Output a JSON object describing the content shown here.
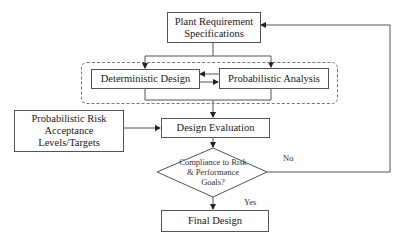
{
  "diagram": {
    "type": "flowchart",
    "nodes": {
      "plant_requirements": {
        "label": "Plant Requirement Specifications",
        "lines": [
          "Plant Requirement",
          "Specifications"
        ]
      },
      "deterministic_design": {
        "label": "Deterministic Design"
      },
      "probabilistic_analysis": {
        "label": "Probabilistic Analysis"
      },
      "risk_acceptance": {
        "label": "Probabilistic Risk Acceptance Levels/Targets",
        "lines": [
          "Probabilistic Risk",
          "Acceptance",
          "Levels/Targets"
        ]
      },
      "design_evaluation": {
        "label": "Design Evaluation"
      },
      "compliance_decision": {
        "label": "Compliance to Risk & Performance Goals?",
        "lines": [
          "Compliance to Risk",
          "& Performance",
          "Goals?"
        ]
      },
      "final_design": {
        "label": "Final Design"
      }
    },
    "edge_labels": {
      "yes": "Yes",
      "no": "No"
    },
    "edges": [
      {
        "from": "plant_requirements",
        "to": "deterministic_design"
      },
      {
        "from": "plant_requirements",
        "to": "probabilistic_analysis"
      },
      {
        "from": "deterministic_design",
        "to": "probabilistic_analysis"
      },
      {
        "from": "probabilistic_analysis",
        "to": "deterministic_design"
      },
      {
        "from": "deterministic_design",
        "to": "design_evaluation"
      },
      {
        "from": "probabilistic_analysis",
        "to": "design_evaluation"
      },
      {
        "from": "risk_acceptance",
        "to": "design_evaluation"
      },
      {
        "from": "design_evaluation",
        "to": "compliance_decision"
      },
      {
        "from": "compliance_decision",
        "to": "final_design",
        "label": "Yes"
      },
      {
        "from": "compliance_decision",
        "to": "plant_requirements",
        "label": "No"
      }
    ]
  }
}
